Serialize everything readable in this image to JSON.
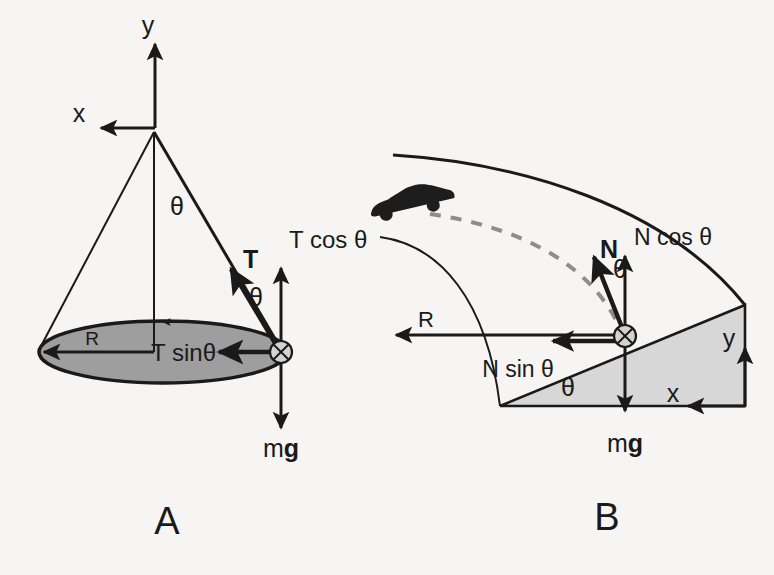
{
  "figure": {
    "background_color": "#f6f5f3",
    "ink_color": "#1a1a1a",
    "disk_fill": "#9e9e9e",
    "wedge_fill": "#d7d7d7",
    "dashed_path_color": "#8d8d8d"
  },
  "panel_a": {
    "label": "A",
    "subject": "conical-pendulum",
    "axes": {
      "x_label": "x",
      "y_label": "y"
    },
    "cone_angle_label": "θ",
    "string_angle_label": "θ",
    "radius_label": "R",
    "forces": [
      {
        "name": "tension",
        "label": "T"
      },
      {
        "name": "tension-vertical-component",
        "label": "T cos θ"
      },
      {
        "name": "tension-horizontal-component",
        "label": "T sinθ"
      },
      {
        "name": "weight",
        "label_prefix": "m",
        "label_suffix": "g"
      }
    ]
  },
  "panel_b": {
    "label": "B",
    "subject": "banked-curve",
    "axes": {
      "x_label": "x",
      "y_label": "y"
    },
    "bank_angle_label": "θ",
    "normal_angle_label": "θ",
    "radius_label": "R",
    "forces": [
      {
        "name": "normal-force",
        "label": "N"
      },
      {
        "name": "normal-vertical-component",
        "label": "N cos θ"
      },
      {
        "name": "normal-horizontal-component",
        "label": "N sin θ"
      },
      {
        "name": "weight",
        "label_prefix": "m",
        "label_suffix": "g"
      }
    ],
    "vehicle": "car-icon",
    "trajectory": "dashed-curved-path"
  }
}
